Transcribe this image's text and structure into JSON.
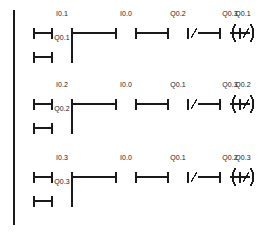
{
  "diagram": {
    "type": "ladder-logic",
    "stroke_color": "#1a1a1a",
    "background_color": "#ffffff",
    "rail": {
      "label": "left-power-rail",
      "x": 14,
      "y_top": 10,
      "y_bottom": 225
    },
    "symbols": {
      "contact_no": "normally-open-contact",
      "contact_nc": "normally-closed-contact",
      "coil": "output-coil",
      "nc_marker": "/",
      "coil_left": "(",
      "coil_right": ")"
    },
    "rungs": [
      {
        "name": "rung-1",
        "y_main": 33,
        "y_branch": 57,
        "main_contact": {
          "label": "I0.1",
          "type": "contact_no",
          "x": 62
        },
        "branch_contact": {
          "label": "Q0.1",
          "type": "contact_no",
          "x": 62
        },
        "rail_contact": {
          "label": "",
          "type": "contact_no",
          "x": 24
        },
        "rail_branch_contact": {
          "label": "",
          "type": "contact_no",
          "x": 24
        },
        "series": [
          {
            "label": "I0.0",
            "type": "contact_no",
            "x": 126
          },
          {
            "label": "Q0.2",
            "type": "contact_nc",
            "x": 178
          },
          {
            "label": "Q0.3",
            "type": "contact_nc",
            "x": 230
          }
        ],
        "coil": {
          "label": "Q0.1",
          "type": "coil",
          "x": 243
        }
      },
      {
        "name": "rung-2",
        "y_main": 104,
        "y_branch": 128,
        "main_contact": {
          "label": "I0.2",
          "type": "contact_no",
          "x": 62
        },
        "branch_contact": {
          "label": "Q0.2",
          "type": "contact_no",
          "x": 62
        },
        "rail_contact": {
          "label": "",
          "type": "contact_no",
          "x": 24
        },
        "rail_branch_contact": {
          "label": "",
          "type": "contact_no",
          "x": 24
        },
        "series": [
          {
            "label": "I0.0",
            "type": "contact_no",
            "x": 126
          },
          {
            "label": "Q0.1",
            "type": "contact_nc",
            "x": 178
          },
          {
            "label": "Q0.3",
            "type": "contact_nc",
            "x": 230
          }
        ],
        "coil": {
          "label": "Q0.2",
          "type": "coil",
          "x": 243
        }
      },
      {
        "name": "rung-3",
        "y_main": 177,
        "y_branch": 201,
        "main_contact": {
          "label": "I0.3",
          "type": "contact_no",
          "x": 62
        },
        "branch_contact": {
          "label": "Q0.3",
          "type": "contact_no",
          "x": 62
        },
        "rail_contact": {
          "label": "",
          "type": "contact_no",
          "x": 24
        },
        "rail_branch_contact": {
          "label": "",
          "type": "contact_no",
          "x": 24
        },
        "series": [
          {
            "label": "I0.0",
            "type": "contact_no",
            "x": 126
          },
          {
            "label": "Q0.1",
            "type": "contact_nc",
            "x": 178
          },
          {
            "label": "Q0.2",
            "type": "contact_nc",
            "x": 230
          }
        ],
        "coil": {
          "label": "Q0.3",
          "type": "coil",
          "x": 243
        }
      }
    ]
  }
}
